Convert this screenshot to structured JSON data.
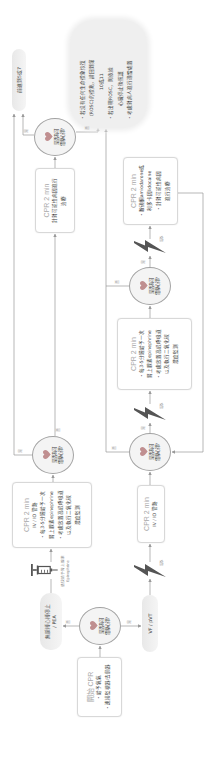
{
  "start": {
    "title": "開始 CPR",
    "items": [
      "・給予氧氣",
      "・連接監視器/去顫器"
    ]
  },
  "decisions": [
    {
      "line1": "是否為可",
      "line2": "電擊心律?"
    },
    {
      "line1": "是否為可",
      "line2": "電擊心律?"
    },
    {
      "line1": "是否為可",
      "line2": "電擊心律?"
    },
    {
      "line1": "是否為可",
      "line2": "電擊心律?"
    },
    {
      "line1": "是否為可",
      "line2": "電擊心律?"
    }
  ],
  "branches": {
    "start_to_nonshockable": "否",
    "start_to_shockable": "是",
    "asystole_check_yes": "是",
    "asystole_check_no": "否",
    "reversible_check_yes": "是",
    "reversible_check_no": "否",
    "vf_check1_no": "否",
    "vf_check1_yes": "是",
    "vf_check2_no": "否",
    "vf_check2_yes": "是"
  },
  "rhythms": {
    "nonshockable": {
      "line1": "無脈搏心搏停止",
      "line2": "/ PEA"
    },
    "shockable": "VF / pVT"
  },
  "epinephrine_note": {
    "line1": "儘快給予腎上腺素",
    "line2": "Epinephrine"
  },
  "shock_labels": [
    "電擊",
    "電擊",
    "電擊"
  ],
  "boxes": {
    "asystole_1": {
      "title": "CPR 2 min",
      "lines": [
        "IV / IO 管路",
        "・每3-5分鐘給予一次",
        "腎上腺素epinephrine",
        "・考慮放置高級呼吸道",
        "以及執行二氧化碳",
        "濃度監測"
      ]
    },
    "asystole_2": {
      "title": "CPR 2 min",
      "lines": [
        "針對可逆性病因進行",
        "治療"
      ]
    },
    "vf_1": {
      "title": "CPR 2 min",
      "lines": [
        "IV / IO 管路"
      ]
    },
    "vf_2": {
      "title": "CPR 2 min",
      "lines": [
        "・每3-5分鐘給予一次",
        "腎上腺素epinephrine",
        "・考慮放置高級呼吸道",
        "以及執行二氧化碳",
        "濃度監測"
      ]
    },
    "vf_3": {
      "title": "CPR 2 min",
      "lines": [
        "・胺碘酮amiodarone或",
        "利多卡因lidocaine",
        "・針對可逆性病因",
        "進行治療"
      ]
    }
  },
  "goto_node": "前進到5或7",
  "rosc_note": {
    "lines": [
      "・若沒有任何生命徵象恢復",
      "(ROSC)的徵兆，請回到第",
      "10或11",
      "・若出現ROSC，則依據",
      "心臟停止後照護",
      "・考慮對病人進行適當處置"
    ]
  },
  "icons": {
    "decision": "heart-icon",
    "shock": "lightning-bolt-icon",
    "drug": "syringe-icon"
  },
  "colors": {
    "heart": "#c08f90",
    "connector": "#9a9a9a",
    "text": "#444444",
    "title": "#a8a8a8",
    "icon": "#555555"
  }
}
